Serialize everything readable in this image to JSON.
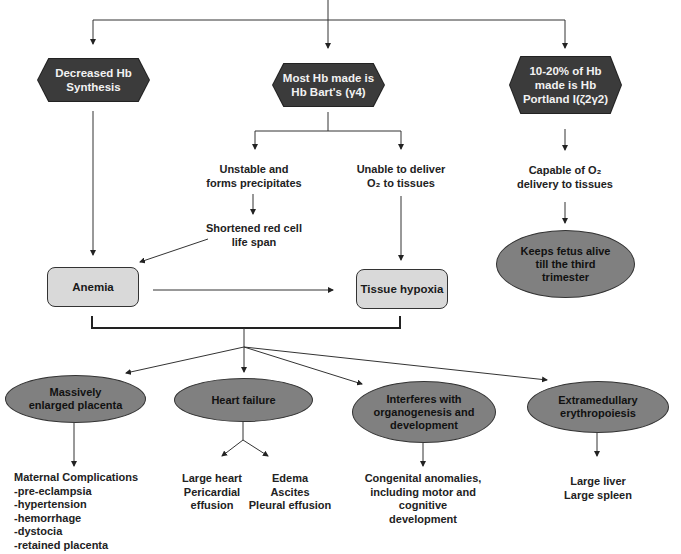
{
  "diagram": {
    "top_nodes": {
      "decreased_synthesis": [
        "Decreased Hb",
        "Synthesis"
      ],
      "hb_barts": [
        "Most Hb made is",
        "Hb Bart's (γ4)"
      ],
      "hb_portland": [
        "10-20% of Hb",
        "made is Hb",
        "Portland I(ζ2γ2)"
      ]
    },
    "middle": {
      "unstable": [
        "Unstable and",
        "forms precipitates"
      ],
      "unable_deliver": [
        "Unable to deliver",
        "O₂ to tissues"
      ],
      "shortened": [
        "Shortened red cell",
        "life span"
      ],
      "capable": [
        "Capable of O₂",
        "delivery to tissues"
      ],
      "keeps_alive": [
        "Keeps fetus alive",
        "till the third",
        "trimester"
      ],
      "anemia": "Anemia",
      "tissue_hypoxia": "Tissue hypoxia"
    },
    "outcomes": {
      "placenta": [
        "Massively",
        "enlarged placenta"
      ],
      "heart_failure": [
        "Heart failure"
      ],
      "organogenesis": [
        "Interferes with",
        "organogenesis and",
        "development"
      ],
      "extramedullary": [
        "Extramedullary",
        "erythropoiesis"
      ]
    },
    "details": {
      "maternal": [
        "Maternal Complications",
        "-pre-eclampsia",
        "-hypertension",
        "-hemorrhage",
        "-dystocia",
        "-retained placenta"
      ],
      "large_heart": [
        "Large heart",
        "Pericardial",
        "effusion"
      ],
      "edema": [
        "Edema",
        "Ascites",
        "Pleural effusion"
      ],
      "congenital": [
        "Congenital anomalies,",
        "including motor and",
        "cognitive",
        "development"
      ],
      "liver_spleen": [
        "Large liver",
        "Large spleen"
      ]
    },
    "colors": {
      "hexagon_fill": "#3b3b3b",
      "box_fill": "#d9d9d9",
      "oval_fill": "#808080",
      "line": "#333333"
    }
  }
}
